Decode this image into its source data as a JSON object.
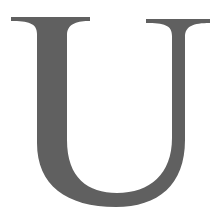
{
  "glyph": {
    "character": "U",
    "style": "serif",
    "fill_color": "#606060",
    "background_color": "#ffffff"
  }
}
